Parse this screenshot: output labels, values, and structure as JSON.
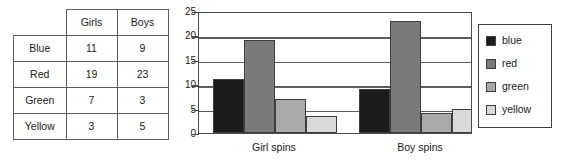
{
  "table": {
    "corner_label": "",
    "column_headers": [
      "Girls",
      "Boys"
    ],
    "rows": [
      {
        "label": "Blue",
        "girls": "11",
        "boys": "9"
      },
      {
        "label": "Red",
        "girls": "19",
        "boys": "23"
      },
      {
        "label": "Green",
        "girls": "7",
        "boys": "3"
      },
      {
        "label": "Yellow",
        "girls": "3",
        "boys": "5"
      }
    ]
  },
  "legend": {
    "items": [
      {
        "label": "blue",
        "color": "#1c1c1c"
      },
      {
        "label": "red",
        "color": "#7a7a7a"
      },
      {
        "label": "green",
        "color": "#a9a9a9"
      },
      {
        "label": "yellow",
        "color": "#d9d9d9"
      }
    ]
  },
  "chart_data": {
    "type": "bar",
    "title": "",
    "xlabel": "",
    "ylabel": "",
    "categories": [
      "Girl spins",
      "Boy spins"
    ],
    "series": [
      {
        "name": "blue",
        "color": "#1c1c1c",
        "values": [
          11,
          9
        ]
      },
      {
        "name": "red",
        "color": "#7a7a7a",
        "values": [
          19,
          23
        ]
      },
      {
        "name": "green",
        "color": "#a9a9a9",
        "values": [
          7,
          4
        ]
      },
      {
        "name": "yellow",
        "color": "#d9d9d9",
        "values": [
          3.5,
          5
        ]
      }
    ],
    "ylim": [
      0,
      25
    ],
    "yticks": [
      0,
      5,
      10,
      15,
      20,
      25
    ],
    "ytick_labels": [
      "0",
      "5",
      "10",
      "15",
      "20",
      "25"
    ],
    "grid": true,
    "legend_position": "right"
  }
}
